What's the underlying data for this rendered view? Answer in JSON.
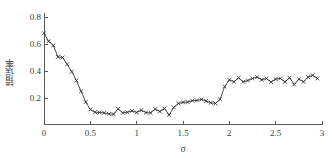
{
  "chart_data": {
    "type": "line",
    "title": "",
    "xlabel": "σ",
    "ylabel": "错误率",
    "xlim": [
      0,
      3
    ],
    "ylim": [
      0,
      0.85
    ],
    "xticks": [
      "0",
      "0.5",
      "1",
      "1.5",
      "2",
      "2.5",
      "3"
    ],
    "xtick_values": [
      0,
      0.5,
      1,
      1.5,
      2,
      2.5,
      3
    ],
    "yticks": [
      "0.2",
      "0.4",
      "0.6",
      "0.8"
    ],
    "ytick_values": [
      0.2,
      0.4,
      0.6,
      0.8
    ],
    "grid": false,
    "legend": null,
    "marker": "x",
    "line_color": "#2a2a2a",
    "series": [
      {
        "name": "错误率",
        "x": [
          0.0,
          0.05,
          0.1,
          0.15,
          0.2,
          0.25,
          0.3,
          0.35,
          0.4,
          0.45,
          0.5,
          0.55,
          0.6,
          0.65,
          0.7,
          0.75,
          0.8,
          0.85,
          0.9,
          0.95,
          1.0,
          1.05,
          1.1,
          1.15,
          1.2,
          1.25,
          1.3,
          1.35,
          1.4,
          1.45,
          1.5,
          1.55,
          1.6,
          1.65,
          1.7,
          1.75,
          1.8,
          1.85,
          1.9,
          1.95,
          2.0,
          2.05,
          2.1,
          2.15,
          2.2,
          2.25,
          2.3,
          2.35,
          2.4,
          2.45,
          2.5,
          2.55,
          2.6,
          2.65,
          2.7,
          2.75,
          2.8,
          2.85,
          2.9,
          2.95
        ],
        "y": [
          0.68,
          0.62,
          0.59,
          0.505,
          0.5,
          0.45,
          0.395,
          0.33,
          0.25,
          0.17,
          0.115,
          0.095,
          0.093,
          0.09,
          0.082,
          0.08,
          0.12,
          0.09,
          0.095,
          0.105,
          0.093,
          0.11,
          0.092,
          0.09,
          0.118,
          0.1,
          0.122,
          0.075,
          0.13,
          0.16,
          0.168,
          0.17,
          0.18,
          0.182,
          0.19,
          0.178,
          0.165,
          0.16,
          0.19,
          0.285,
          0.335,
          0.32,
          0.35,
          0.32,
          0.33,
          0.345,
          0.355,
          0.335,
          0.345,
          0.318,
          0.34,
          0.345,
          0.32,
          0.35,
          0.3,
          0.34,
          0.32,
          0.355,
          0.368,
          0.345
        ]
      }
    ]
  }
}
